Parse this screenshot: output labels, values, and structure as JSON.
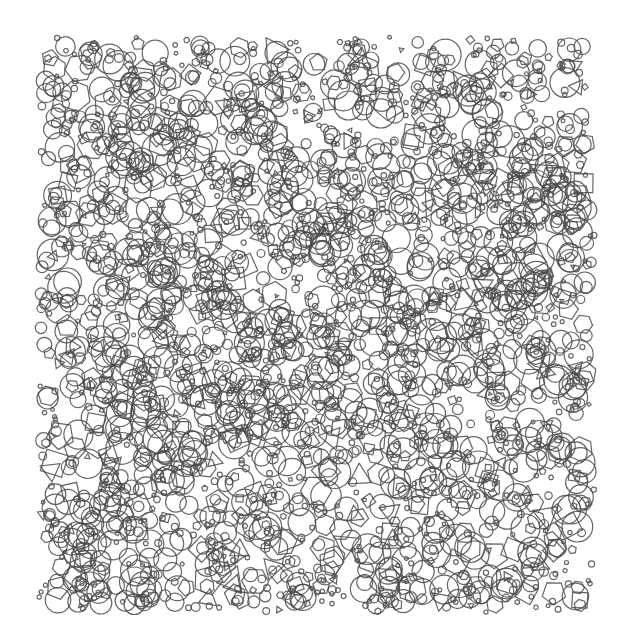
{
  "artwork": {
    "kind": "generative-pattern",
    "background": "#ffffff",
    "stroke_color": "#4a4a4a",
    "stroke_width": 1.2,
    "stroke_opacity": 0.85,
    "region": {
      "x": 35,
      "y": 35,
      "width": 562,
      "height": 580
    },
    "shape_count": 2600,
    "seed": 20240611,
    "shape_types": [
      {
        "name": "circle",
        "sides": 0,
        "weight": 0.62
      },
      {
        "name": "hexagon",
        "sides": 6,
        "weight": 0.14
      },
      {
        "name": "pentagon",
        "sides": 5,
        "weight": 0.1
      },
      {
        "name": "square",
        "sides": 4,
        "weight": 0.08
      },
      {
        "name": "triangle",
        "sides": 3,
        "weight": 0.06
      }
    ],
    "radius": {
      "min": 2,
      "max": 16,
      "bias": 1.6
    }
  }
}
